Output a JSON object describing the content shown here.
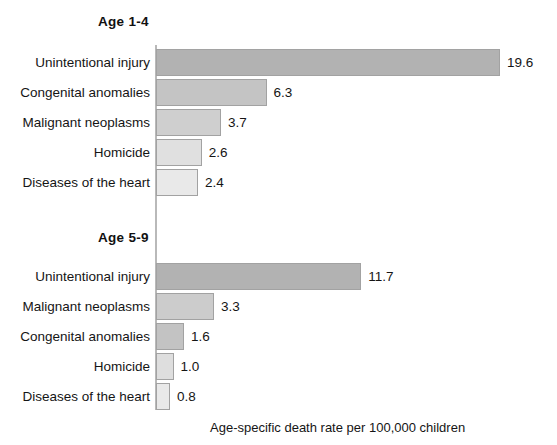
{
  "chart_data": {
    "type": "bar",
    "title": "",
    "xlabel": "Age-specific death rate per 100,000 children",
    "ylabel": "",
    "orientation": "horizontal",
    "grid": false,
    "legend": "none",
    "xlim": [
      0,
      19.6
    ],
    "panels": [
      {
        "title": "Age 1-4",
        "categories": [
          "Unintentional injury",
          "Congenital anomalies",
          "Malignant neoplasms",
          "Homicide",
          "Diseases of the heart"
        ],
        "values": [
          19.6,
          6.3,
          3.7,
          2.6,
          2.4
        ],
        "value_labels": [
          "19.6",
          "6.3",
          "3.7",
          "2.6",
          "2.4"
        ],
        "bar_colors": [
          "#b2b2b2",
          "#c4c4c4",
          "#cfcfcf",
          "#e0e0e0",
          "#e9e9e9"
        ]
      },
      {
        "title": "Age 5-9",
        "categories": [
          "Unintentional injury",
          "Malignant neoplasms",
          "Congenital anomalies",
          "Homicide",
          "Diseases of the heart"
        ],
        "values": [
          11.7,
          3.3,
          1.6,
          1.0,
          0.8
        ],
        "value_labels": [
          "11.7",
          "3.3",
          "1.6",
          "1.0",
          "0.8"
        ],
        "bar_colors": [
          "#b2b2b2",
          "#cccccc",
          "#c3c3c3",
          "#dedede",
          "#e9e9e9"
        ]
      }
    ]
  },
  "caption": "Age-specific death rate per 100,000 children",
  "colors": {
    "axis": "#b9b9b9",
    "bar_outline": "#a2a2a2",
    "text": "#151515",
    "background": "#ffffff"
  },
  "layout": {
    "axis_x": 156,
    "px_per_unit": 17.55,
    "row_height": 30,
    "panel1_title_top": 14,
    "panel1_first_row_top": 48,
    "panel2_title_top": 230,
    "panel2_first_row_top": 262,
    "caption_left": 210,
    "caption_top": 420
  }
}
